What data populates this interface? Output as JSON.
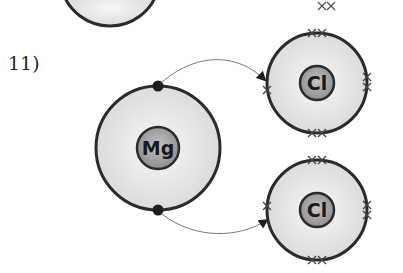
{
  "question": {
    "number_label": "11)"
  },
  "diagram": {
    "colors": {
      "shell_fill": "#e8e8e8",
      "shell_stroke": "#2b2b2b",
      "nucleus_fill": "#a9a9a9",
      "electron_dot": "#1e1e1e",
      "cross": "#444444",
      "arrow": "#6a6a6a"
    },
    "atoms": [
      {
        "id": "mg",
        "symbol": "Mg",
        "outer_electrons": "2 dots (top and bottom)"
      },
      {
        "id": "cl-top",
        "symbol": "Cl",
        "outer_electrons": "7 crosses"
      },
      {
        "id": "cl-bottom",
        "symbol": "Cl",
        "outer_electrons": "7 crosses"
      }
    ],
    "arrows": [
      {
        "from": "mg top electron",
        "to": "cl-top left side"
      },
      {
        "from": "mg bottom electron",
        "to": "cl-bottom left side"
      }
    ]
  }
}
